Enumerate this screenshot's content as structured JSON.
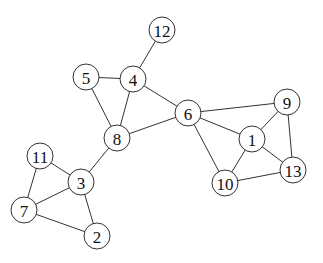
{
  "graph": {
    "nodes": [
      {
        "id": "1",
        "label": "1",
        "x": 252,
        "y": 139
      },
      {
        "id": "2",
        "label": "2",
        "x": 97,
        "y": 236
      },
      {
        "id": "3",
        "label": "3",
        "x": 81,
        "y": 182
      },
      {
        "id": "4",
        "label": "4",
        "x": 133,
        "y": 79
      },
      {
        "id": "5",
        "label": "5",
        "x": 86,
        "y": 77
      },
      {
        "id": "6",
        "label": "6",
        "x": 188,
        "y": 113
      },
      {
        "id": "7",
        "label": "7",
        "x": 24,
        "y": 210
      },
      {
        "id": "8",
        "label": "8",
        "x": 117,
        "y": 138
      },
      {
        "id": "9",
        "label": "9",
        "x": 287,
        "y": 102
      },
      {
        "id": "10",
        "label": "10",
        "x": 225,
        "y": 183
      },
      {
        "id": "11",
        "label": "11",
        "x": 40,
        "y": 156
      },
      {
        "id": "12",
        "label": "12",
        "x": 162,
        "y": 30
      },
      {
        "id": "13",
        "label": "13",
        "x": 293,
        "y": 170
      }
    ],
    "edges": [
      [
        "12",
        "4"
      ],
      [
        "5",
        "4"
      ],
      [
        "5",
        "8"
      ],
      [
        "4",
        "8"
      ],
      [
        "4",
        "6"
      ],
      [
        "8",
        "6"
      ],
      [
        "8",
        "3"
      ],
      [
        "6",
        "9"
      ],
      [
        "6",
        "1"
      ],
      [
        "6",
        "10"
      ],
      [
        "9",
        "1"
      ],
      [
        "9",
        "13"
      ],
      [
        "1",
        "13"
      ],
      [
        "1",
        "10"
      ],
      [
        "10",
        "13"
      ],
      [
        "11",
        "3"
      ],
      [
        "11",
        "7"
      ],
      [
        "7",
        "3"
      ],
      [
        "7",
        "2"
      ],
      [
        "3",
        "2"
      ]
    ],
    "node_radius": 13
  }
}
